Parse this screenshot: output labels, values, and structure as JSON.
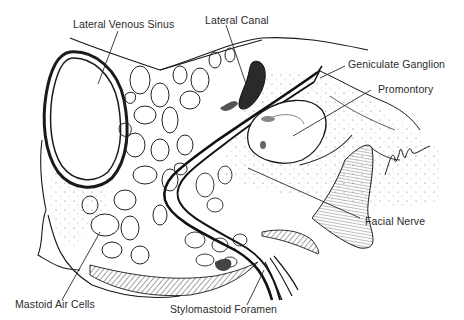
{
  "diagram": {
    "type": "anatomical-illustration",
    "labels": [
      {
        "id": "lateral-venous-sinus",
        "text": "Lateral Venous Sinus"
      },
      {
        "id": "lateral-canal",
        "text": "Lateral Canal"
      },
      {
        "id": "geniculate-ganglion",
        "text": "Geniculate Ganglion"
      },
      {
        "id": "promontory",
        "text": "Promontory"
      },
      {
        "id": "facial-nerve",
        "text": "Facial Nerve"
      },
      {
        "id": "mastoid-air-cells",
        "text": "Mastoid Air Cells"
      },
      {
        "id": "stylomastoid-foramen",
        "text": "Stylomastoid Foramen"
      }
    ],
    "colors": {
      "ink": "#1a1a1a",
      "label": "#2a2a2a",
      "background": "#ffffff",
      "shade": "#5a5a5a"
    }
  }
}
